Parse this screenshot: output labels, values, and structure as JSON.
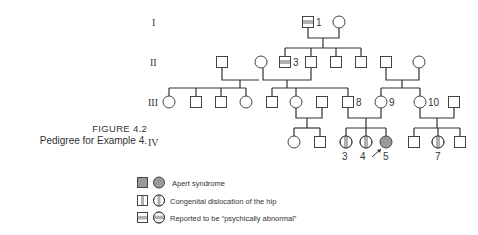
{
  "figure": {
    "number": "FIGURE 4.2",
    "title": "Pedigree for Example 4."
  },
  "generations": [
    "I",
    "II",
    "III",
    "IV"
  ],
  "individual_labels": {
    "I_1": "1",
    "II_3": "3",
    "III_8": "8",
    "III_9": "9",
    "III_10": "10",
    "IV_3": "3",
    "IV_4": "4",
    "IV_5": "5",
    "IV_7": "7"
  },
  "legend": [
    {
      "pattern": "solid-gray",
      "label": "Apert syndrome"
    },
    {
      "pattern": "vertical-band",
      "label": "Congenital dislocation of the hip"
    },
    {
      "pattern": "horizontal-band",
      "label": "Reported to be “psychically abnormal”"
    }
  ],
  "colors": {
    "affected_fill": "#9a9a9a",
    "line": "#333333",
    "band": "#b0b0b0"
  },
  "proband": "IV_5"
}
